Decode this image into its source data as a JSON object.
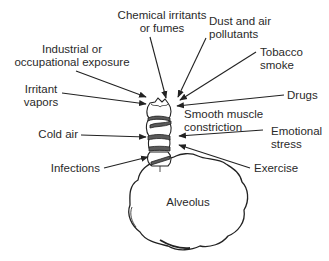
{
  "diagram": {
    "center": {
      "airway_label": "Smooth muscle\nconstriction",
      "alveolus_label": "Alveolus"
    },
    "triggers": [
      {
        "id": "chemical",
        "label": "Chemical irritants\nor fumes"
      },
      {
        "id": "dust",
        "label": "Dust and air\npollutants"
      },
      {
        "id": "industrial",
        "label": "Industrial or\noccupational exposure"
      },
      {
        "id": "tobacco",
        "label": "Tobacco\nsmoke"
      },
      {
        "id": "irritant-vapors",
        "label": "Irritant\nvapors"
      },
      {
        "id": "drugs",
        "label": "Drugs"
      },
      {
        "id": "cold-air",
        "label": "Cold air"
      },
      {
        "id": "emotional-stress",
        "label": "Emotional\nstress"
      },
      {
        "id": "infections",
        "label": "Infections"
      },
      {
        "id": "exercise",
        "label": "Exercise"
      }
    ],
    "colors": {
      "line": "#222222",
      "text": "#2a2a2a",
      "band": "#555555",
      "background": "#ffffff"
    }
  }
}
